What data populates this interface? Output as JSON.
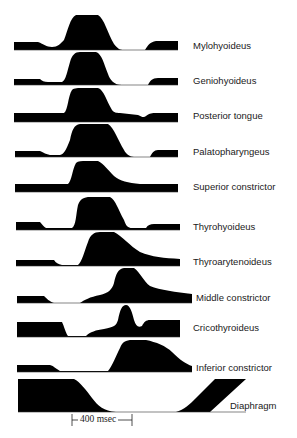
{
  "figure": {
    "type": "EMG activity timing diagram",
    "trace_color": "#000000",
    "background": "#ffffff",
    "traces": [
      {
        "label": "Mylohyoideus",
        "label_x": 193,
        "label_y": 41,
        "path": "M14,50 L14,42 L38,42 C44,44 46,47 52,47 C58,47 60,44 64,40 C68,30 70,18 76,15 L98,15 C104,18 108,34 114,44 C118,49 120,50 124,50 L145,50 C148,45 150,42 156,41 L178,41 L178,50 Z"
      },
      {
        "label": "Geniohyoideus",
        "label_x": 193,
        "label_y": 76,
        "path": "M14,85 L14,79 L40,79 C42,81 44,82 48,82 L62,82 C66,80 67,72 70,62 C72,55 75,52 80,52 L96,52 C102,54 104,64 108,74 C110,80 114,85 122,85 L148,85 C150,81 152,78 158,78 L178,78 L178,85 Z"
      },
      {
        "label": "Posterior tongue",
        "label_x": 193,
        "label_y": 111,
        "path": "M14,122 L14,113 L64,113 C68,110 68,96 72,90 C74,88 78,88 84,88 L98,88 C104,90 106,100 112,110 C114,113 118,113 120,113 L138,115 C142,117 144,118 146,116 C150,113 152,113 156,113 L178,113 L178,122 Z"
      },
      {
        "label": "Palatopharyngeus",
        "label_x": 193,
        "label_y": 147,
        "path": "M15,157 L15,151 L40,151 C44,153 46,154 50,155 L60,155 C64,154 66,150 70,140 C72,130 74,125 80,124 L108,124 C114,128 118,140 124,150 C126,154 130,157 134,157 L150,157 C152,153 154,150 158,150 L178,150 L178,157 Z"
      },
      {
        "label": "Superior constrictor",
        "label_x": 193,
        "label_y": 182,
        "path": "M15,192 L15,184 L68,184 C72,180 72,170 76,163 C78,161 82,161 86,161 L98,161 C104,164 108,170 114,176 C120,181 128,183 140,184 L178,184 L178,192 Z"
      },
      {
        "label": "Thyrohyoideus",
        "label_x": 193,
        "label_y": 222,
        "path": "M16,230 L16,222 L40,222 C42,224 44,227 46,228 L72,228 C76,226 76,214 78,205 C80,199 84,197 90,197 L110,197 C116,200 118,210 124,220 C126,226 128,228 132,228 L146,228 C148,225 150,224 154,224 L180,224 L180,230 Z"
      },
      {
        "label": "Thyroarytenoideus",
        "label_x": 193,
        "label_y": 257,
        "path": "M16,266 L16,260 L54,260 C56,263 58,264 62,265 L78,265 C82,262 84,252 88,242 C90,235 94,232 100,232 L114,232 C122,236 130,246 140,252 C152,257 164,258 180,259 L180,266 Z"
      },
      {
        "label": "Middle constrictor",
        "label_x": 196,
        "label_y": 293,
        "path": "M17,303 L17,296 L44,296 C46,298 50,302 54,303 L80,303 C84,300 90,297 100,295 C108,293 112,290 114,283 C116,274 118,269 124,268 L134,268 C140,272 144,282 150,286 C160,290 176,292 192,294 L192,303 Z"
      },
      {
        "label": "Cricothyroideus",
        "label_x": 193,
        "label_y": 323,
        "path": "M17,337 L17,322 L62,322 C64,326 66,334 68,336 L86,336 C90,332 96,330 104,329 C114,327 116,326 118,320 C120,310 122,305 126,305 C130,305 132,312 134,320 C136,326 138,328 142,326 C144,322 146,320 150,320 L180,320 L180,337 Z"
      },
      {
        "label": "Inferior constrictor",
        "label_x": 196,
        "label_y": 363,
        "path": "M17,372 L17,365 L50,365 C54,366 56,369 60,371 L108,371 C112,366 116,356 120,348 C122,342 126,340 132,340 L146,340 C156,342 166,346 172,352 C180,360 186,364 192,366 L192,372 Z"
      },
      {
        "label": "Diaphragm",
        "label_x": 230,
        "label_y": 401,
        "path": "M18,412 L18,379 L74,379 C80,382 86,390 92,398 C98,406 104,411 116,412 L176,412 C184,410 190,404 196,398 L215,379 L246,379 L210,412 Z"
      }
    ],
    "scale_bar": {
      "label": "400 msec",
      "x1": 72,
      "x2": 132,
      "y": 420
    }
  }
}
